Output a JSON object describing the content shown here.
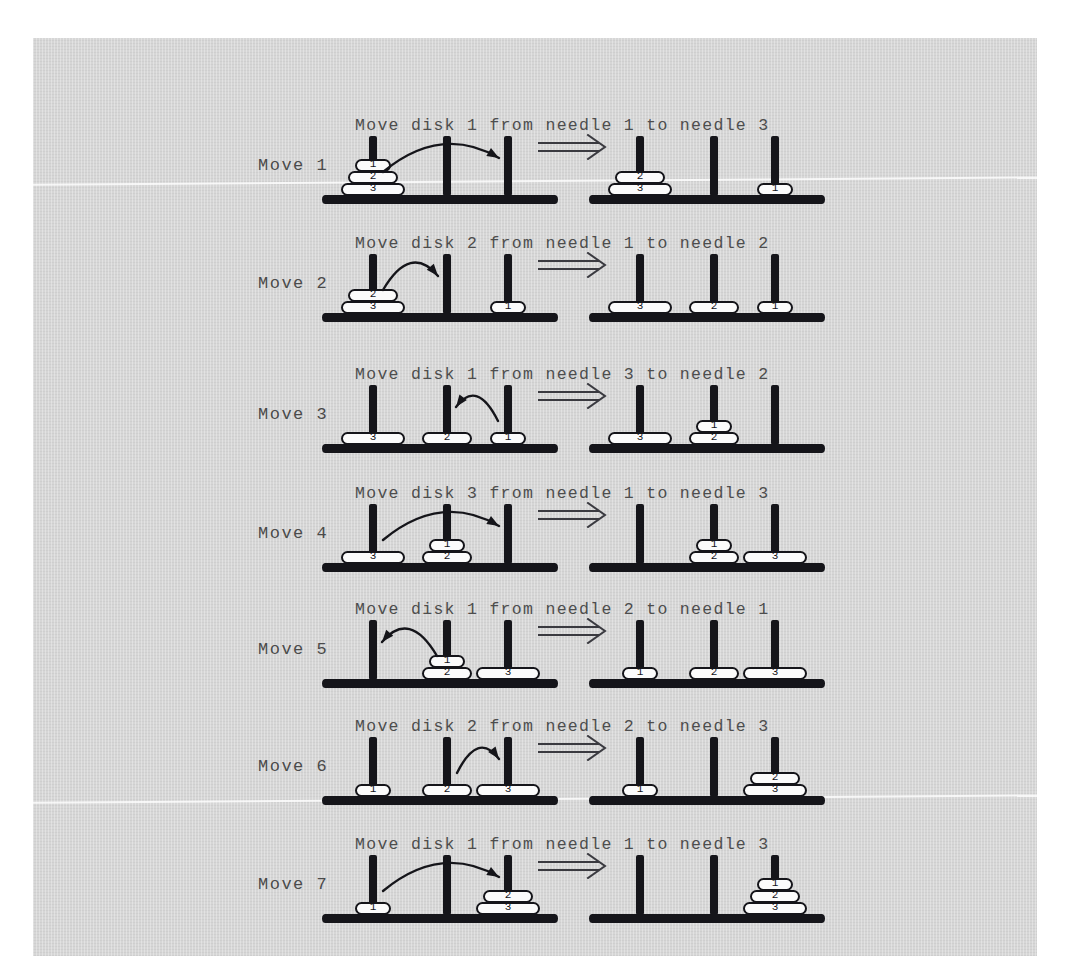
{
  "figure": {
    "page_background": "#d6d6d6",
    "ink_color": "#15151a",
    "text_color": "#4d4d4d",
    "transition_symbol": "implies-double-arrow",
    "needle_count": 3,
    "disk_count": 3,
    "disk_labels": [
      "1",
      "2",
      "3"
    ],
    "total_moves": 7
  },
  "moves": [
    {
      "label": "Move 1",
      "caption": "Move disk 1 from needle 1 to needle 3",
      "disk": "1",
      "from_needle": 1,
      "to_needle": 3,
      "before": [
        [
          "1",
          "2",
          "3"
        ],
        [],
        []
      ],
      "after": [
        [
          "2",
          "3"
        ],
        [],
        [
          "1"
        ]
      ],
      "arrow_direction": "right"
    },
    {
      "label": "Move 2",
      "caption": "Move disk 2 from needle 1 to needle 2",
      "disk": "2",
      "from_needle": 1,
      "to_needle": 2,
      "before": [
        [
          "2",
          "3"
        ],
        [],
        [
          "1"
        ]
      ],
      "after": [
        [
          "3"
        ],
        [
          "2"
        ],
        [
          "1"
        ]
      ],
      "arrow_direction": "right"
    },
    {
      "label": "Move 3",
      "caption": "Move disk 1 from needle 3 to needle 2",
      "disk": "1",
      "from_needle": 3,
      "to_needle": 2,
      "before": [
        [
          "3"
        ],
        [
          "2"
        ],
        [
          "1"
        ]
      ],
      "after": [
        [
          "3"
        ],
        [
          "1",
          "2"
        ],
        []
      ],
      "arrow_direction": "left"
    },
    {
      "label": "Move 4",
      "caption": "Move disk 3 from needle 1 to needle 3",
      "disk": "3",
      "from_needle": 1,
      "to_needle": 3,
      "before": [
        [
          "3"
        ],
        [
          "1",
          "2"
        ],
        []
      ],
      "after": [
        [],
        [
          "1",
          "2"
        ],
        [
          "3"
        ]
      ],
      "arrow_direction": "right"
    },
    {
      "label": "Move 5",
      "caption": "Move disk 1 from needle 2 to needle 1",
      "disk": "1",
      "from_needle": 2,
      "to_needle": 1,
      "before": [
        [],
        [
          "1",
          "2"
        ],
        [
          "3"
        ]
      ],
      "after": [
        [
          "1"
        ],
        [
          "2"
        ],
        [
          "3"
        ]
      ],
      "arrow_direction": "left"
    },
    {
      "label": "Move 6",
      "caption": "Move disk 2 from needle 2 to needle 3",
      "disk": "2",
      "from_needle": 2,
      "to_needle": 3,
      "before": [
        [
          "1"
        ],
        [
          "2"
        ],
        [
          "3"
        ]
      ],
      "after": [
        [
          "1"
        ],
        [],
        [
          "2",
          "3"
        ]
      ],
      "arrow_direction": "right"
    },
    {
      "label": "Move 7",
      "caption": "Move disk 1 from needle 1 to needle 3",
      "disk": "1",
      "from_needle": 1,
      "to_needle": 3,
      "before": [
        [
          "1"
        ],
        [],
        [
          "2",
          "3"
        ]
      ],
      "after": [
        [],
        [],
        [
          "1",
          "2",
          "3"
        ]
      ],
      "arrow_direction": "right"
    }
  ]
}
